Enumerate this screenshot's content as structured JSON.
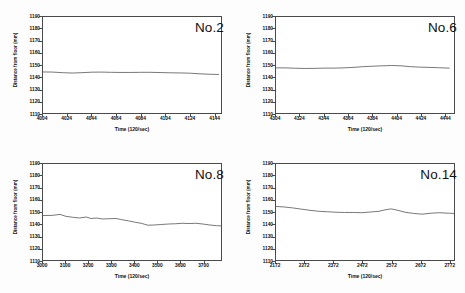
{
  "figure": {
    "background": "#fdfdfd",
    "axis_color": "#4a4a4a",
    "line_color": "#555555",
    "text_color": "#0d0d0d"
  },
  "chart_data": [
    {
      "type": "line",
      "title": "No.2",
      "xlabel": "Time (120/sec)",
      "ylabel": "Distance from floor (mm)",
      "xlim": [
        4004,
        4150
      ],
      "ylim": [
        1110,
        1190
      ],
      "xticks": [
        4004,
        4024,
        4044,
        4064,
        4084,
        4104,
        4124,
        4144
      ],
      "yticks": [
        1110,
        1120,
        1130,
        1140,
        1150,
        1160,
        1170,
        1180,
        1190
      ],
      "grid": false,
      "legend": "none",
      "x": [
        4004,
        4012,
        4020,
        4028,
        4036,
        4044,
        4052,
        4060,
        4068,
        4076,
        4084,
        4092,
        4100,
        4108,
        4116,
        4124,
        4132,
        4140,
        4148
      ],
      "values": [
        1144.2,
        1144.1,
        1143.6,
        1143.3,
        1143.6,
        1144.0,
        1144.1,
        1143.9,
        1143.8,
        1143.8,
        1143.9,
        1143.9,
        1143.7,
        1143.5,
        1143.4,
        1143.2,
        1142.7,
        1142.3,
        1142.1
      ]
    },
    {
      "type": "line",
      "title": "No.6",
      "xlabel": "Time (120/sec)",
      "ylabel": "Distance from floor (mm)",
      "xlim": [
        4304,
        4452
      ],
      "ylim": [
        1110,
        1190
      ],
      "xticks": [
        4304,
        4324,
        4344,
        4364,
        4384,
        4404,
        4424,
        4444
      ],
      "yticks": [
        1110,
        1120,
        1130,
        1140,
        1150,
        1160,
        1170,
        1180,
        1190
      ],
      "grid": false,
      "legend": "none",
      "x": [
        4304,
        4312,
        4320,
        4328,
        4336,
        4344,
        4352,
        4360,
        4368,
        4376,
        4384,
        4392,
        4400,
        4408,
        4416,
        4424,
        4432,
        4440,
        4448
      ],
      "values": [
        1147.6,
        1147.6,
        1147.3,
        1147.1,
        1147.2,
        1147.4,
        1147.4,
        1147.6,
        1148.0,
        1148.6,
        1149.0,
        1149.3,
        1149.6,
        1149.3,
        1148.6,
        1148.2,
        1148.0,
        1147.7,
        1147.4
      ]
    },
    {
      "type": "line",
      "title": "No.8",
      "xlabel": "Time (120/sec)",
      "ylabel": "Distance from floor (mm)",
      "xlim": [
        3000,
        3780
      ],
      "ylim": [
        1110,
        1190
      ],
      "xticks": [
        3000,
        3100,
        3200,
        3300,
        3400,
        3500,
        3600,
        3700
      ],
      "yticks": [
        1110,
        1120,
        1130,
        1140,
        1150,
        1160,
        1170,
        1180,
        1190
      ],
      "grid": false,
      "legend": "none",
      "x": [
        3000,
        3040,
        3075,
        3100,
        3130,
        3160,
        3190,
        3210,
        3235,
        3260,
        3290,
        3320,
        3345,
        3375,
        3400,
        3430,
        3460,
        3490,
        3520,
        3550,
        3580,
        3610,
        3640,
        3670,
        3700,
        3730,
        3760,
        3780
      ],
      "values": [
        1147.0,
        1147.2,
        1148.0,
        1146.4,
        1145.6,
        1145.0,
        1145.8,
        1144.6,
        1145.0,
        1144.2,
        1144.4,
        1144.6,
        1143.6,
        1142.6,
        1141.6,
        1140.6,
        1139.0,
        1139.2,
        1139.6,
        1140.0,
        1140.2,
        1140.6,
        1140.4,
        1140.6,
        1140.0,
        1139.2,
        1138.6,
        1138.4
      ]
    },
    {
      "type": "line",
      "title": "No.14",
      "xlabel": "Time (120/sec)",
      "ylabel": "Distance from floor (mm)",
      "xlim": [
        2172,
        2790
      ],
      "ylim": [
        1110,
        1190
      ],
      "xticks": [
        2172,
        2272,
        2372,
        2472,
        2572,
        2672,
        2772
      ],
      "yticks": [
        1110,
        1120,
        1130,
        1140,
        1150,
        1160,
        1170,
        1180,
        1190
      ],
      "grid": false,
      "legend": "none",
      "x": [
        2172,
        2200,
        2230,
        2260,
        2290,
        2320,
        2350,
        2380,
        2410,
        2440,
        2470,
        2500,
        2530,
        2550,
        2572,
        2595,
        2620,
        2650,
        2680,
        2710,
        2740,
        2770,
        2790
      ],
      "values": [
        1154.6,
        1154.2,
        1153.4,
        1152.4,
        1151.4,
        1150.6,
        1150.2,
        1149.8,
        1149.6,
        1149.6,
        1149.4,
        1150.0,
        1150.6,
        1151.8,
        1152.6,
        1151.4,
        1149.8,
        1148.8,
        1148.2,
        1149.0,
        1149.4,
        1149.0,
        1148.8
      ]
    }
  ]
}
